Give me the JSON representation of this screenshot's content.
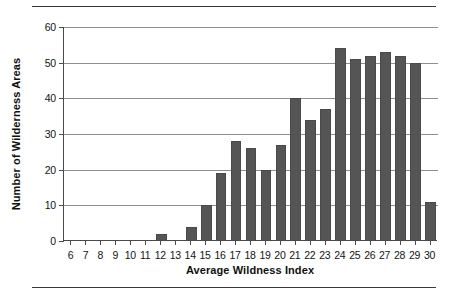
{
  "chart_data": {
    "type": "bar",
    "title": "",
    "xlabel": "Average Wildness Index",
    "ylabel": "Number of Wilderness Areas",
    "categories": [
      "6",
      "7",
      "8",
      "9",
      "10",
      "11",
      "12",
      "13",
      "14",
      "15",
      "16",
      "17",
      "18",
      "19",
      "20",
      "21",
      "22",
      "23",
      "24",
      "25",
      "26",
      "27",
      "28",
      "29",
      "30"
    ],
    "values": [
      0,
      0,
      0,
      0,
      0,
      0,
      2,
      0,
      4,
      10,
      19,
      28,
      26,
      20,
      27,
      40,
      34,
      37,
      54,
      51,
      52,
      53,
      52,
      50,
      11
    ],
    "ylim": [
      0,
      60
    ],
    "yticks": [
      0,
      10,
      20,
      30,
      40,
      50,
      60
    ],
    "ytick_labels": [
      "0",
      "10",
      "20",
      "30",
      "40",
      "50",
      "60"
    ],
    "xlim": [
      "6",
      "30"
    ],
    "grid": "horizontal",
    "legend": "none",
    "bar_color": "#555555",
    "gridline_color": "#8f8f8f",
    "axis_color": "#4a4a4a",
    "rule_color": "#3a3a3a"
  }
}
